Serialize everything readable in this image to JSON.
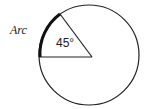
{
  "diagram": {
    "type": "circle-sector",
    "arc_label": "Arc",
    "angle_label": "45°",
    "angle_degrees": 45,
    "colors": {
      "stroke": "#222222",
      "arc_highlight": "#111111",
      "background": "#ffffff"
    }
  }
}
